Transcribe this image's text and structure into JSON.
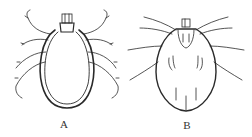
{
  "figure": {
    "panels": [
      {
        "label": "A",
        "subject": "tick-dorsal-view-female"
      },
      {
        "label": "B",
        "subject": "tick-dorsal-view-male"
      }
    ],
    "colors": {
      "ink": "#2a2a2a",
      "background": "#ffffff"
    }
  }
}
